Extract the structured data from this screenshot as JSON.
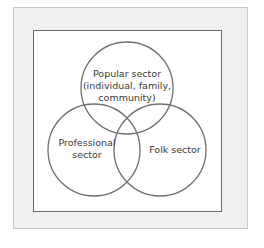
{
  "diagram": {
    "type": "venn",
    "colors": {
      "panel_background": "#f0f0f0",
      "box_border": "#6a6a6a",
      "circle_stroke": "#6e6e6e",
      "text": "#3a3a3a"
    },
    "circles": [
      {
        "id": "popular",
        "label_lines": [
          "Popular sector",
          "(individual, family,",
          "community)"
        ]
      },
      {
        "id": "professional",
        "label_lines": [
          "Professional",
          "sector"
        ]
      },
      {
        "id": "folk",
        "label_lines": [
          "Folk sector"
        ]
      }
    ]
  }
}
